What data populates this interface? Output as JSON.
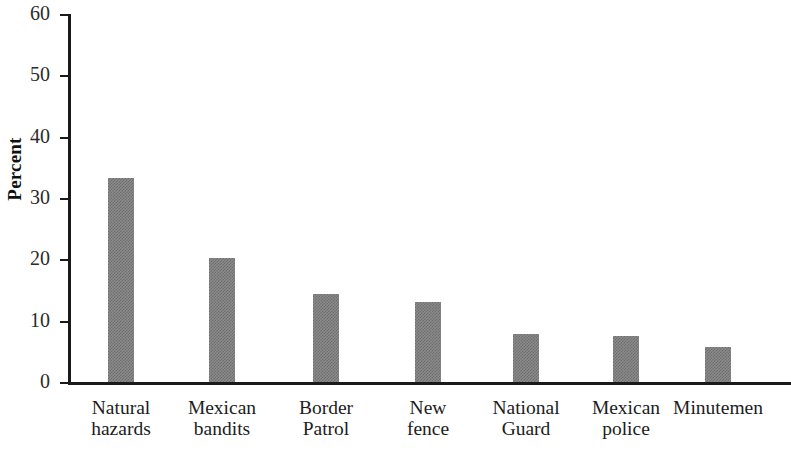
{
  "chart_data": {
    "type": "bar",
    "title": "",
    "xlabel": "",
    "ylabel": "Percent",
    "ylim": [
      0,
      60
    ],
    "yticks": [
      0,
      10,
      20,
      30,
      40,
      50,
      60
    ],
    "ytick_labels": [
      "0",
      "10",
      "20",
      "30",
      "40",
      "50",
      "60"
    ],
    "grid": false,
    "legend": "none",
    "bar_color": "#808080",
    "bar_fill_style": "checkerboard-dither-gray",
    "axis_color": "#1a1a1a",
    "categories": [
      "Natural\nhazards",
      "Mexican\nbandits",
      "Border\nPatrol",
      "New\nfence",
      "National\nGuard",
      "Mexican\npolice",
      "Minutemen"
    ],
    "values": [
      33.3,
      20.2,
      14.4,
      13.1,
      7.8,
      7.5,
      5.7
    ]
  },
  "axis": {
    "y_title": "Percent"
  }
}
